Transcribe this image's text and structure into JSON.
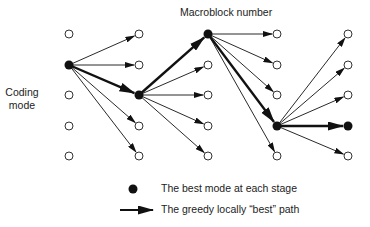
{
  "labels": {
    "y_axis_line1": "Coding",
    "y_axis_line2": "mode",
    "x_axis": "Macroblock number"
  },
  "legend": [
    {
      "symbol": "filled-dot",
      "text": "The best mode at each stage"
    },
    {
      "symbol": "thick-arrow",
      "text": "The greedy locally “best” path"
    }
  ],
  "graph": {
    "columns_x": [
      69,
      139,
      208,
      277,
      348
    ],
    "rows_y": [
      34,
      65,
      95,
      126,
      156
    ],
    "best_mode_row_per_stage": [
      1,
      2,
      0,
      3,
      3
    ],
    "edges": [
      {
        "from_col": 0,
        "from_row": 1,
        "to_rows": [
          0,
          1,
          2,
          3,
          4
        ],
        "best_to_row": 2
      },
      {
        "from_col": 1,
        "from_row": 2,
        "to_rows": [
          0,
          1,
          2,
          3,
          4
        ],
        "best_to_row": 0
      },
      {
        "from_col": 2,
        "from_row": 0,
        "to_rows": [
          0,
          1,
          2,
          3,
          4
        ],
        "best_to_row": 3
      },
      {
        "from_col": 3,
        "from_row": 3,
        "to_rows": [
          0,
          1,
          2,
          3,
          4
        ],
        "best_to_row": 3
      }
    ]
  },
  "colors": {
    "stroke": "#111111",
    "text": "#222222",
    "background": "#ffffff"
  }
}
